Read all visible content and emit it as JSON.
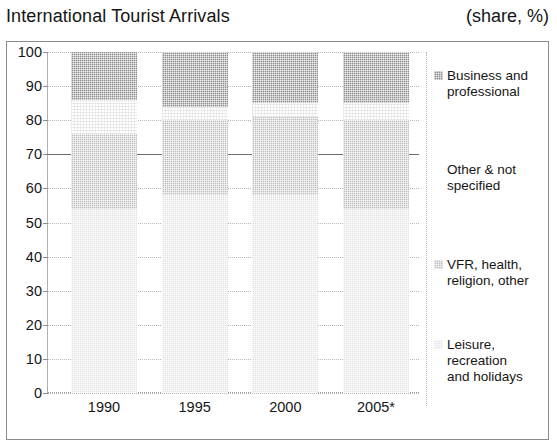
{
  "header": {
    "title": "International Tourist Arrivals",
    "units": "(share, %)"
  },
  "chart_data": {
    "type": "bar",
    "subtype": "stacked-bar-100",
    "title": "International Tourist Arrivals",
    "units_label": "(share, %)",
    "xlabel": "",
    "ylabel": "",
    "ylim": [
      0,
      100
    ],
    "ytick_labels": [
      "0",
      "10",
      "20",
      "30",
      "40",
      "50",
      "60",
      "70",
      "80",
      "90",
      "100"
    ],
    "ytick_values": [
      0,
      10,
      20,
      30,
      40,
      50,
      60,
      70,
      80,
      90,
      100
    ],
    "grid": true,
    "reference_line": 70,
    "legend_position": "right",
    "categories": [
      "1990",
      "1995",
      "2000",
      "2005*"
    ],
    "series": [
      {
        "name": "Leisure, recreation and holidays",
        "legend_line_1": "Leisure, recreation",
        "legend_line_2": "and holidays",
        "color": "#e0e0e0",
        "values": [
          54,
          58,
          58,
          54
        ]
      },
      {
        "name": "VFR, health, religion, other",
        "legend_line_1": "VFR, health,",
        "legend_line_2": "religion, other",
        "color": "#bdbdbd",
        "values": [
          22,
          22,
          23,
          26
        ]
      },
      {
        "name": "Other & not specified",
        "legend_line_1": "Other & not",
        "legend_line_2": "specified",
        "color": "#ffffff",
        "values": [
          10,
          4,
          4,
          5
        ]
      },
      {
        "name": "Business and professional",
        "legend_line_1": "Business and",
        "legend_line_2": "professional",
        "color": "#8d8d8d",
        "values": [
          14,
          16,
          15,
          15
        ]
      }
    ],
    "stack_boundaries": {
      "1990": {
        "leisure_top": 54,
        "vfr_top": 76,
        "other_top": 86,
        "business_top": 100
      },
      "1995": {
        "leisure_top": 58,
        "vfr_top": 80,
        "other_top": 84,
        "business_top": 100
      },
      "2000": {
        "leisure_top": 58,
        "vfr_top": 81,
        "other_top": 85,
        "business_top": 100
      },
      "2005*": {
        "leisure_top": 54,
        "vfr_top": 80,
        "other_top": 85,
        "business_top": 100
      }
    }
  }
}
